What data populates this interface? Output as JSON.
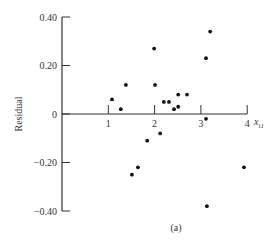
{
  "chart_data": {
    "type": "scatter",
    "title": "",
    "caption": "(a)",
    "xlabel": "x",
    "xlabel_subscript": "i1",
    "ylabel": "Residual",
    "xlim": [
      0,
      4
    ],
    "ylim": [
      -0.4,
      0.4
    ],
    "x_ticks": [
      1,
      2,
      3,
      4
    ],
    "x_tick_labels": [
      "1",
      "2",
      "3",
      "4"
    ],
    "y_ticks": [
      0.4,
      0.2,
      0,
      -0.2,
      -0.4
    ],
    "y_tick_labels": [
      "0.40",
      "0.20",
      "0",
      "−0.20",
      "−0.40"
    ],
    "grid": false,
    "legend": null,
    "marker_color": "#111111",
    "axis_color": "#333333",
    "points": [
      {
        "x": 1.08,
        "y": 0.06
      },
      {
        "x": 1.27,
        "y": 0.02
      },
      {
        "x": 1.38,
        "y": 0.12
      },
      {
        "x": 1.99,
        "y": 0.27
      },
      {
        "x": 2.01,
        "y": 0.12
      },
      {
        "x": 2.2,
        "y": 0.05
      },
      {
        "x": 2.31,
        "y": 0.05
      },
      {
        "x": 2.42,
        "y": 0.02
      },
      {
        "x": 2.51,
        "y": 0.03
      },
      {
        "x": 2.51,
        "y": 0.08
      },
      {
        "x": 2.7,
        "y": 0.08
      },
      {
        "x": 3.11,
        "y": 0.23
      },
      {
        "x": 3.2,
        "y": 0.34
      },
      {
        "x": 3.11,
        "y": -0.02
      },
      {
        "x": 2.12,
        "y": -0.08
      },
      {
        "x": 1.84,
        "y": -0.11
      },
      {
        "x": 1.64,
        "y": -0.22
      },
      {
        "x": 1.51,
        "y": -0.25
      },
      {
        "x": 3.93,
        "y": -0.22
      },
      {
        "x": 3.13,
        "y": -0.38
      }
    ]
  }
}
